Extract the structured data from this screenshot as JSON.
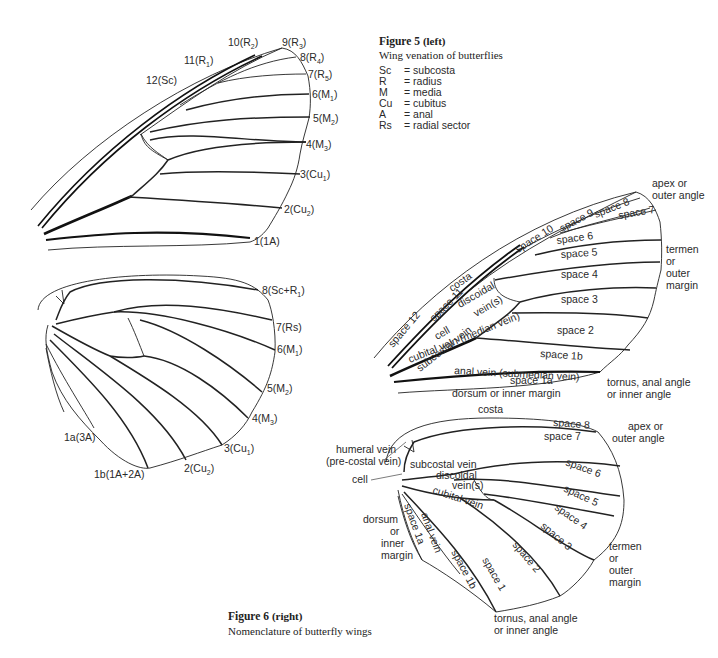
{
  "figure5": {
    "title": "Figure 5",
    "qualifier": "(left)",
    "subtitle": "Wing venation of butterflies",
    "legend": [
      {
        "abbr": "Sc",
        "eq": "=",
        "meaning": "subcosta"
      },
      {
        "abbr": "R",
        "eq": "=",
        "meaning": "radius"
      },
      {
        "abbr": "M",
        "eq": "=",
        "meaning": "media"
      },
      {
        "abbr": "Cu",
        "eq": "=",
        "meaning": "cubitus"
      },
      {
        "abbr": "A",
        "eq": "=",
        "meaning": "anal"
      },
      {
        "abbr": "Rs",
        "eq": "=",
        "meaning": "radial sector"
      }
    ],
    "forewing_veins": [
      {
        "num": "12",
        "name": "Sc",
        "sub": ""
      },
      {
        "num": "11",
        "name": "R",
        "sub": "1"
      },
      {
        "num": "10",
        "name": "R",
        "sub": "2"
      },
      {
        "num": "9",
        "name": "R",
        "sub": "3"
      },
      {
        "num": "8",
        "name": "R",
        "sub": "4"
      },
      {
        "num": "7",
        "name": "R",
        "sub": "5"
      },
      {
        "num": "6",
        "name": "M",
        "sub": "1"
      },
      {
        "num": "5",
        "name": "M",
        "sub": "2"
      },
      {
        "num": "4",
        "name": "M",
        "sub": "3"
      },
      {
        "num": "3",
        "name": "Cu",
        "sub": "1"
      },
      {
        "num": "2",
        "name": "Cu",
        "sub": "2"
      },
      {
        "num": "1",
        "name": "1A",
        "sub": ""
      }
    ],
    "hindwing_veins": [
      {
        "num": "8",
        "name": "Sc+R",
        "sub": "1"
      },
      {
        "num": "7",
        "name": "Rs",
        "sub": ""
      },
      {
        "num": "6",
        "name": "M",
        "sub": "1"
      },
      {
        "num": "5",
        "name": "M",
        "sub": "2"
      },
      {
        "num": "4",
        "name": "M",
        "sub": "3"
      },
      {
        "num": "3",
        "name": "Cu",
        "sub": "1"
      },
      {
        "num": "2",
        "name": "Cu",
        "sub": "2"
      },
      {
        "num": "1b",
        "name": "1A+2A",
        "sub": ""
      },
      {
        "num": "1a",
        "name": "3A",
        "sub": ""
      }
    ]
  },
  "figure6": {
    "title": "Figure 6",
    "qualifier": "(right)",
    "subtitle": "Nomenclature of butterfly wings",
    "forewing": {
      "costa": "costa",
      "apex": [
        "apex or",
        "outer angle"
      ],
      "termen": [
        "termen",
        "or",
        "outer",
        "margin"
      ],
      "tornus": [
        "tornus, anal angle",
        "or inner angle"
      ],
      "dorsum": "dorsum or inner margin",
      "spaces": [
        "space 12",
        "space 11",
        "space 10",
        "space 9",
        "space 8",
        "space 7",
        "space 6",
        "space 5",
        "space 4",
        "space 3",
        "space 2",
        "space 1b",
        "space 1a"
      ],
      "veins": {
        "subcostal": "subcostal vein",
        "discoidal": [
          "discoidal",
          "vein(s)"
        ],
        "cell": "cell",
        "cubital": "cubital vein (median vein)",
        "anal": "anal vein (submedian vein)"
      }
    },
    "hindwing": {
      "costa": "costa",
      "apex": [
        "apex or",
        "outer angle"
      ],
      "termen": [
        "termen",
        "or",
        "outer",
        "margin"
      ],
      "tornus": [
        "tornus, anal angle",
        "or inner angle"
      ],
      "dorsum": [
        "dorsum",
        "or",
        "inner",
        "margin"
      ],
      "humeral": [
        "humeral vein",
        "(pre-costal vein)"
      ],
      "cell": "cell",
      "spaces": [
        "space 8",
        "space 7",
        "space 6",
        "space 5",
        "space 4",
        "space 3",
        "space 2",
        "space 1",
        "space 1b",
        "space 1a"
      ],
      "veins": {
        "subcostal": "subcostal vein",
        "discoidal": [
          "discoidal",
          "vein(s)"
        ],
        "cubital": "cubital vein",
        "anal": "anal vein"
      }
    }
  }
}
